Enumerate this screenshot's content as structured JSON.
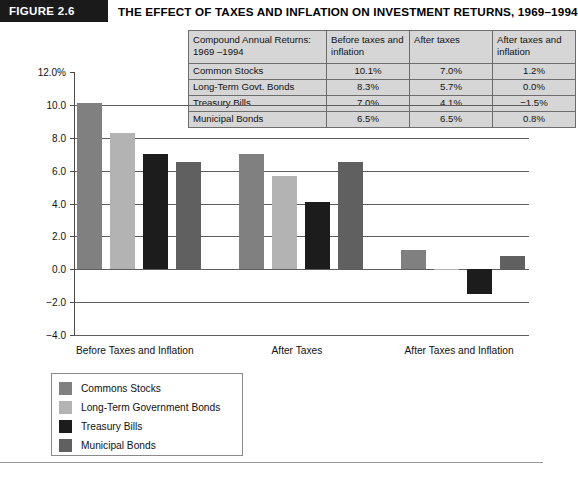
{
  "figure": {
    "tag": "FIGURE 2.6",
    "title": "THE EFFECT OF TAXES AND INFLATION ON INVESTMENT RETURNS, 1969–1994"
  },
  "table": {
    "headers": [
      "Compound Annual Returns: 1969 –1994",
      "Before taxes and inflation",
      "After taxes",
      "After taxes and inflation"
    ],
    "rows": [
      {
        "label": "Common Stocks",
        "before": "10.1%",
        "after": "7.0%",
        "after_inflation": "1.2%"
      },
      {
        "label": "Long-Term Govt. Bonds",
        "before": "8.3%",
        "after": "5.7%",
        "after_inflation": "0.0%"
      },
      {
        "label": "Treasury Bills",
        "before": "7.0%",
        "after": "4.1%",
        "after_inflation": "−1.5%"
      },
      {
        "label": "Municipal Bonds",
        "before": "6.5%",
        "after": "6.5%",
        "after_inflation": "0.8%"
      }
    ]
  },
  "legend": {
    "items": [
      {
        "label": "Commons Stocks",
        "color": "#808080"
      },
      {
        "label": "Long-Term Government Bonds",
        "color": "#b3b3b3"
      },
      {
        "label": "Treasury Bills",
        "color": "#1c1c1c"
      },
      {
        "label": "Municipal Bonds",
        "color": "#606060"
      }
    ]
  },
  "chart_data": {
    "type": "bar",
    "title": "THE EFFECT OF TAXES AND INFLATION ON INVESTMENT RETURNS, 1969–1994",
    "xlabel": "",
    "ylabel": "",
    "categories": [
      "Before Taxes and Inflation",
      "After Taxes",
      "After Taxes and Inflation"
    ],
    "series": [
      {
        "name": "Commons Stocks",
        "color": "#808080",
        "values": [
          10.1,
          7.0,
          1.2
        ]
      },
      {
        "name": "Long-Term Government Bonds",
        "color": "#b3b3b3",
        "values": [
          8.3,
          5.7,
          0.0
        ]
      },
      {
        "name": "Treasury Bills",
        "color": "#1c1c1c",
        "values": [
          7.0,
          4.1,
          -1.5
        ]
      },
      {
        "name": "Municipal Bonds",
        "color": "#606060",
        "values": [
          6.5,
          6.5,
          0.8
        ]
      }
    ],
    "ylim": [
      -4.0,
      12.0
    ],
    "ytick_labels": [
      "12.0%",
      "10.0",
      "8.0",
      "6.0",
      "4.0",
      "2.0",
      "0.0",
      "−2.0",
      "−4.0"
    ],
    "ytick_values": [
      12.0,
      10.0,
      8.0,
      6.0,
      4.0,
      2.0,
      0.0,
      -2.0,
      -4.0
    ],
    "grid": true,
    "legend_position": "below-left"
  }
}
